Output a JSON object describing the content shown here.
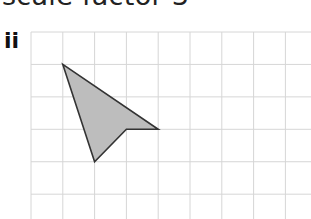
{
  "heading": "scale factor 3",
  "part_label": "ii",
  "grid": {
    "origin_x": 31,
    "origin_y": 32,
    "cell": 31.8,
    "cols": 9,
    "rows": 6,
    "line_color": "#d6d6d6"
  },
  "shape": {
    "fill": "#bdbdbd",
    "stroke": "#333333",
    "vertices_grid": [
      [
        1,
        1
      ],
      [
        4,
        3
      ],
      [
        3,
        3
      ],
      [
        2,
        4
      ]
    ]
  }
}
